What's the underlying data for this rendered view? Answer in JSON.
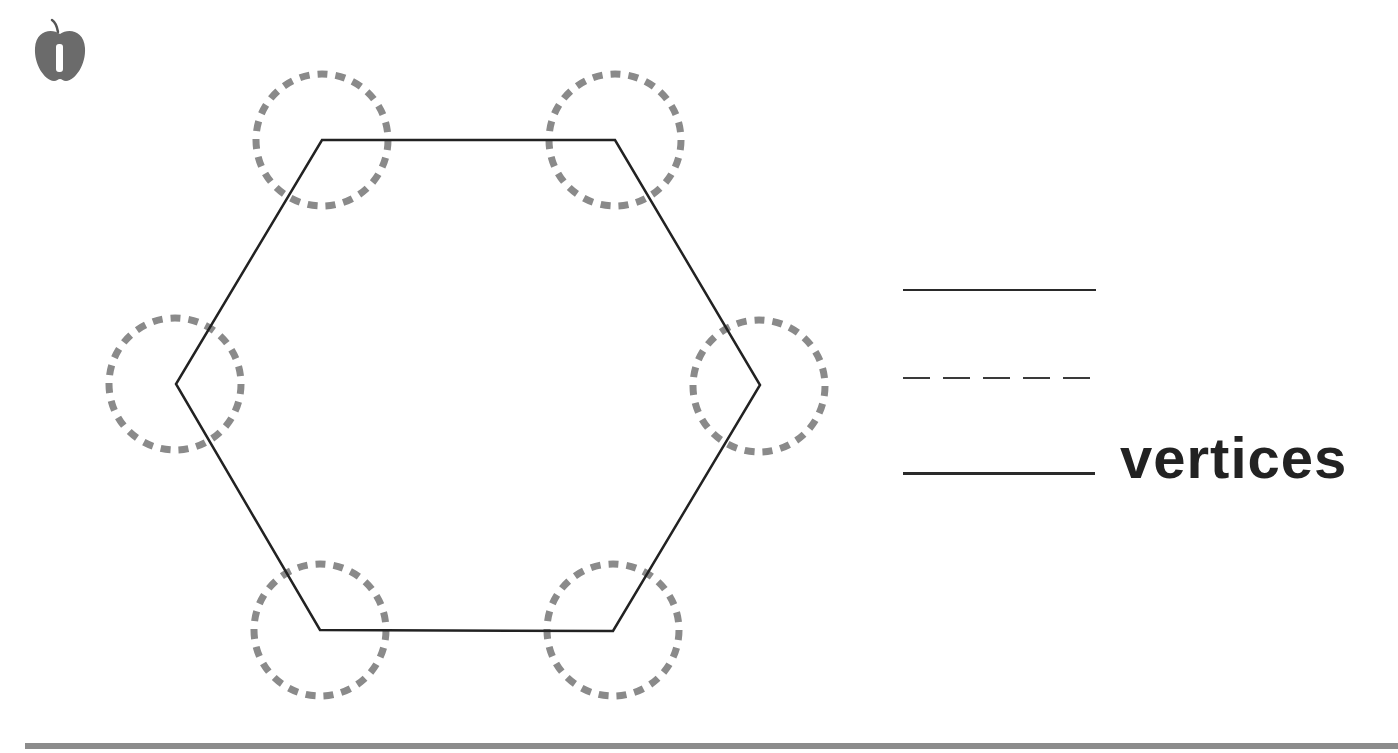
{
  "worksheet": {
    "icon": "apple-icon",
    "shape": {
      "type": "hexagon",
      "vertices": [
        {
          "x": 322,
          "y": 140
        },
        {
          "x": 615,
          "y": 140
        },
        {
          "x": 760,
          "y": 385
        },
        {
          "x": 613,
          "y": 631
        },
        {
          "x": 320,
          "y": 630
        },
        {
          "x": 176,
          "y": 384
        }
      ],
      "stroke_color": "#222222",
      "highlight_circles": {
        "radius": 66,
        "color": "#8a8a8a",
        "count": 6
      }
    },
    "answer_lines": [
      {
        "style": "solid",
        "text": ""
      },
      {
        "style": "dashed",
        "text": ""
      },
      {
        "style": "solid-thick",
        "text": "vertices"
      }
    ],
    "answer_word": "vertices",
    "bottom_rule_color": "#8c8c8c"
  }
}
